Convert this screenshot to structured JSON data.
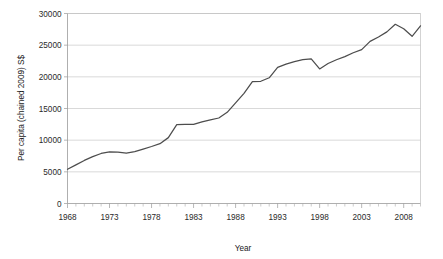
{
  "chart_data": {
    "type": "line",
    "title": "",
    "xlabel": "Year",
    "ylabel": "Per capita (chained 2009) S$",
    "xlim": [
      1968,
      2010
    ],
    "ylim": [
      0,
      30000
    ],
    "grid": true,
    "legend": "none",
    "y_ticks": [
      0,
      5000,
      10000,
      15000,
      20000,
      25000,
      30000
    ],
    "y_tick_labels": [
      "0",
      "5000",
      "10000",
      "15000",
      "20000",
      "25000",
      "30000"
    ],
    "x_ticks": [
      1968,
      1973,
      1978,
      1983,
      1988,
      1993,
      1998,
      2003,
      2008
    ],
    "x_tick_labels": [
      "1968",
      "1973",
      "1978",
      "1983",
      "1988",
      "1993",
      "1998",
      "2003",
      "2008"
    ],
    "x_minor_tick_step": 1,
    "line_color": "#4d4d4d",
    "grid_color": "#c8c8c8",
    "series": [
      {
        "name": "Per capita GDP",
        "x": [
          1968,
          1969,
          1970,
          1971,
          1972,
          1973,
          1974,
          1975,
          1976,
          1977,
          1978,
          1979,
          1980,
          1981,
          1982,
          1983,
          1984,
          1985,
          1986,
          1987,
          1988,
          1989,
          1990,
          1991,
          1992,
          1993,
          1994,
          1995,
          1996,
          1997,
          1998,
          1999,
          2000,
          2001,
          2002,
          2003,
          2004,
          2005,
          2006,
          2007,
          2008,
          2009,
          2010
        ],
        "values": [
          5400,
          6100,
          6800,
          7400,
          7900,
          8150,
          8100,
          7950,
          8200,
          8600,
          9000,
          9450,
          10400,
          12450,
          12500,
          12500,
          12900,
          13200,
          13500,
          14400,
          15900,
          17400,
          19250,
          19300,
          19850,
          21500,
          22000,
          22400,
          22700,
          22850,
          21250,
          22100,
          22700,
          23200,
          23800,
          24300,
          25600,
          26300,
          27100,
          28300,
          27600,
          26400,
          28050
        ]
      }
    ]
  },
  "axis": {
    "x_title": "Year",
    "y_title": "Per capita (chained 2009) S$"
  }
}
